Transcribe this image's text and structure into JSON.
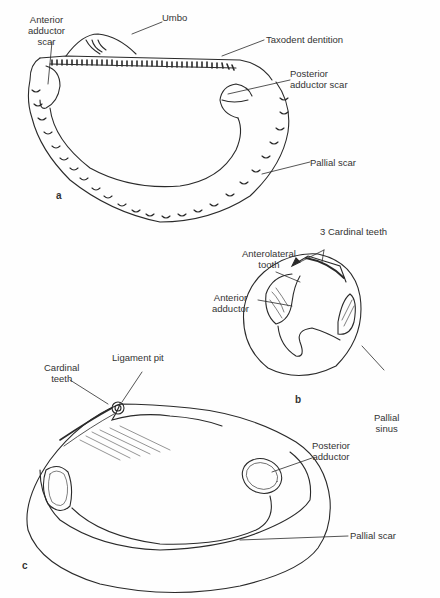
{
  "figure": {
    "panels": [
      {
        "id": "a",
        "letter": "a",
        "labels": {
          "anterior_adductor_scar": "Anterior\nadductor\nscar",
          "umbo": "Umbo",
          "taxodont_dentition": "Taxodent dentition",
          "posterior_adductor_scar": "Posterior\nadductor scar",
          "pallial_scar": "Pallial scar"
        }
      },
      {
        "id": "b",
        "letter": "b",
        "labels": {
          "cardinal_teeth": "3 Cardinal teeth",
          "anterolateral_tooth": "Anterolateral\ntooth",
          "anterior_adductor": "Anterior\nadductor",
          "pallial_sinus": "Pallial\nsinus"
        }
      },
      {
        "id": "c",
        "letter": "c",
        "labels": {
          "cardinal_teeth": "Cardinal\nteeth",
          "ligament_pit": "Ligament pit",
          "posterior_adductor": "Posterior\nadductor",
          "pallial_scar": "Pallial scar"
        }
      }
    ],
    "colors": {
      "ink": "#2a2a2a",
      "background": "#fefefe"
    }
  }
}
